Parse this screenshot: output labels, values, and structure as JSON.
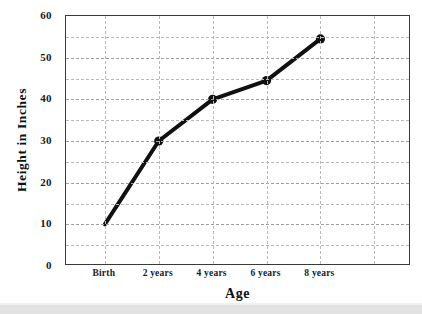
{
  "chart_data": {
    "type": "line",
    "title": "",
    "xlabel": "Age",
    "ylabel": "Height in Inches",
    "categories": [
      "Birth",
      "2 years",
      "4 years",
      "6 years",
      "8 years"
    ],
    "values": [
      10,
      30,
      40,
      44.5,
      54.5
    ],
    "series": [
      {
        "name": "Height",
        "values": [
          10,
          30,
          40,
          44.5,
          54.5
        ]
      }
    ],
    "ylim": [
      0,
      60
    ],
    "ytick_labels": [
      "0",
      "10",
      "20",
      "30",
      "40",
      "50",
      "60"
    ],
    "ytick_values": [
      0,
      10,
      20,
      30,
      40,
      50,
      60
    ],
    "yminor_values": [
      5,
      15,
      25,
      35,
      45,
      55
    ],
    "xtick_labels": [
      "Birth",
      "2 years",
      "4 years",
      "6 years",
      "8 years"
    ],
    "grid": true,
    "grid_style": "dashed",
    "legend": "none",
    "line_color": "#111111",
    "marker_color": "#111111",
    "marker_style": "circle",
    "markers_shown": [
      "2 years",
      "4 years",
      "6 years",
      "8 years"
    ],
    "axis_color": "#3a3a3a",
    "grid_color": "#b9b9b9",
    "background": "#ffffff"
  }
}
